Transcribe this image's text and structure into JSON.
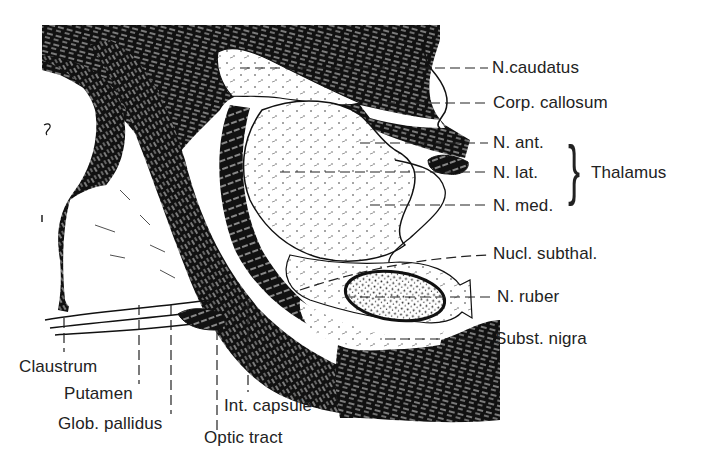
{
  "figure": {
    "type": "anatomical line drawing",
    "colors": {
      "ink": "#111111",
      "paper": "#ffffff",
      "label_text": "#222222"
    }
  },
  "labels_right": [
    {
      "id": "n-caudatus",
      "text": "N.caudatus"
    },
    {
      "id": "corp-callosum",
      "text": "Corp. callosum"
    },
    {
      "id": "n-ant",
      "text": "N. ant."
    },
    {
      "id": "n-lat",
      "text": "N. lat."
    },
    {
      "id": "n-med",
      "text": "N. med."
    },
    {
      "id": "nucl-subthal",
      "text": "Nucl. subthal."
    },
    {
      "id": "n-ruber",
      "text": "N. ruber"
    },
    {
      "id": "subst-nigra",
      "text": "Subst. nigra"
    }
  ],
  "group_label": {
    "text": "Thalamus",
    "members": [
      "N. ant.",
      "N. lat.",
      "N. med."
    ]
  },
  "labels_bottom": [
    {
      "id": "claustrum",
      "text": "Claustrum"
    },
    {
      "id": "putamen",
      "text": "Putamen"
    },
    {
      "id": "glob-pallidus",
      "text": "Glob. pallidus"
    },
    {
      "id": "optic-tract",
      "text": "Optic tract"
    },
    {
      "id": "int-capsule",
      "text": "Int. capsule"
    }
  ]
}
